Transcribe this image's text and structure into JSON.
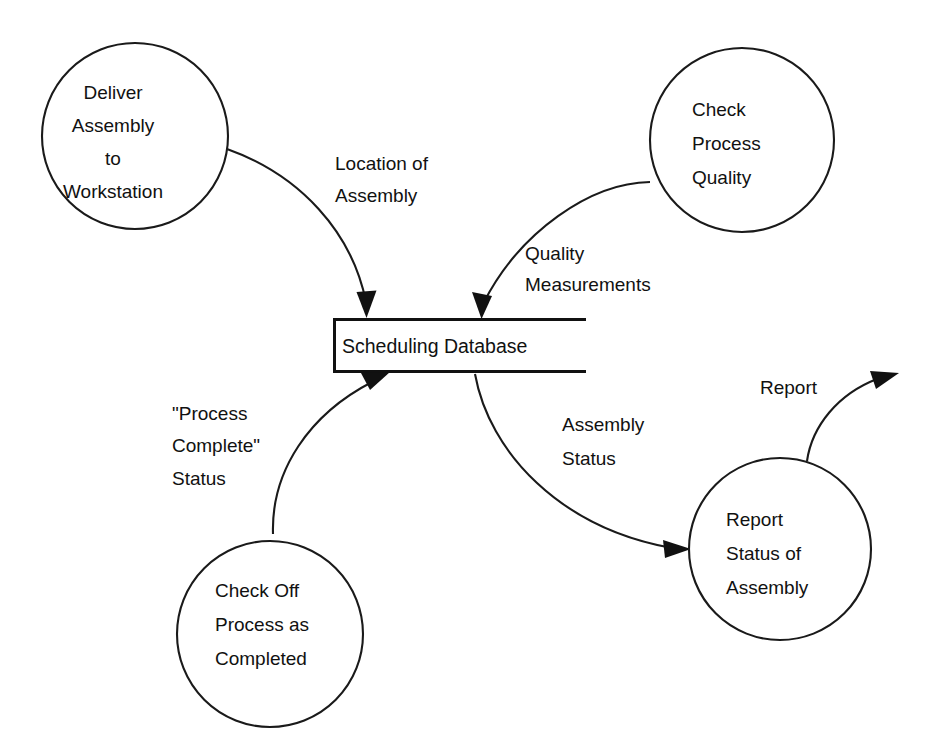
{
  "diagram": {
    "type": "data-flow-diagram",
    "notation": "Yourdon / DeMarco",
    "background_color": "#ffffff",
    "line_color": "#111111",
    "width": 929,
    "height": 755
  },
  "processes": [
    {
      "id": "deliver-assembly",
      "name": "Deliver Assembly to Workstation",
      "lines": [
        "Deliver",
        "Assembly",
        "to",
        "Workstation"
      ],
      "cx": 135,
      "cy": 136,
      "r": 93,
      "text_align": "middle"
    },
    {
      "id": "check-process-quality",
      "name": "Check Process Quality",
      "lines": [
        "Check",
        "Process",
        "Quality"
      ],
      "cx": 742,
      "cy": 140,
      "r": 92,
      "text_align": "start"
    },
    {
      "id": "check-off-process",
      "name": "Check Off Process as Completed",
      "lines": [
        "Check Off",
        "Process as",
        "Completed"
      ],
      "cx": 270,
      "cy": 634,
      "r": 93,
      "text_align": "start"
    },
    {
      "id": "report-status",
      "name": "Report Status of Assembly",
      "lines": [
        "Report",
        "Status of",
        "Assembly"
      ],
      "cx": 780,
      "cy": 549,
      "r": 91,
      "text_align": "start"
    }
  ],
  "data_stores": [
    {
      "id": "scheduling-database",
      "label": "Scheduling Database",
      "x": 333,
      "y": 318,
      "width": 252,
      "height": 55
    }
  ],
  "flows": [
    {
      "id": "location-of-assembly",
      "label": "Location of Assembly",
      "lines": [
        "Location of",
        "Assembly"
      ],
      "from": "deliver-assembly",
      "to": "scheduling-database",
      "label_x": 335,
      "label_y_first": 170,
      "label_align": "start"
    },
    {
      "id": "quality-measurements",
      "label": "Quality Measurements",
      "lines": [
        "Quality",
        "Measurements"
      ],
      "from": "check-process-quality",
      "to": "scheduling-database",
      "label_x": 525,
      "label_y_first": 260,
      "label_align": "start"
    },
    {
      "id": "process-complete-status",
      "label": "\"Process Complete\" Status",
      "lines": [
        "\"Process",
        "Complete\"",
        "Status"
      ],
      "from": "check-off-process",
      "to": "scheduling-database",
      "label_x": 172,
      "label_y_first": 420,
      "label_align": "start"
    },
    {
      "id": "assembly-status",
      "label": "Assembly Status",
      "lines": [
        "Assembly",
        "Status"
      ],
      "from": "scheduling-database",
      "to": "report-status",
      "label_x": 562,
      "label_y_first": 431,
      "label_align": "start"
    },
    {
      "id": "report",
      "label": "Report",
      "lines": [
        "Report"
      ],
      "from": "report-status",
      "to": "external-sink",
      "label_x": 760,
      "label_y_first": 394,
      "label_align": "start"
    }
  ]
}
